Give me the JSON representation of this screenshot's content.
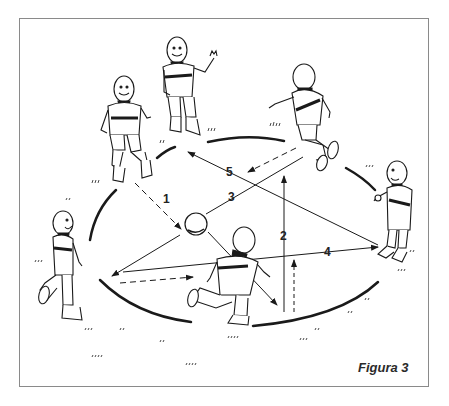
{
  "figure": {
    "caption": "Figura 3"
  },
  "labels": {
    "pass_1": "1",
    "pass_2": "2",
    "pass_3": "3",
    "pass_4": "4",
    "pass_5": "5"
  },
  "players": [
    {
      "id": "player-top-left",
      "pose": "jumping"
    },
    {
      "id": "player-top-center",
      "pose": "waving"
    },
    {
      "id": "player-top-right",
      "pose": "kicking"
    },
    {
      "id": "player-right",
      "pose": "standing"
    },
    {
      "id": "player-bottom-center",
      "pose": "running"
    },
    {
      "id": "player-left",
      "pose": "walking"
    }
  ],
  "colors": {
    "ink": "#1a1a1a",
    "frame": "#8a8a8a",
    "background": "#ffffff"
  }
}
